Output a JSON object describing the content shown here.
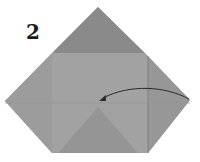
{
  "step": {
    "number": "2"
  },
  "diagram": {
    "type": "origami-step",
    "colors": {
      "paper_top": "#8c8c8c",
      "paper_body": "#9a9a9a",
      "paper_inner": "#a3a3a3",
      "paper_center": "#939393",
      "crease": "#858585",
      "arrow": "#2a2a2a"
    },
    "arrow": {
      "from": "right-corner",
      "to": "center",
      "icon": "fold-arrow-icon"
    }
  }
}
